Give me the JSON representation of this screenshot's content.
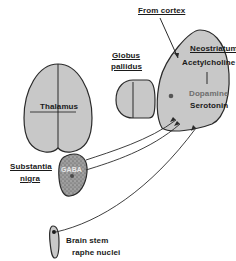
{
  "diagram": {
    "structures": {
      "thalamus": {
        "label": "Thalamus"
      },
      "globus_pallidus": {
        "label_line1": "Globus",
        "label_line2": "pallidus"
      },
      "neostriatum": {
        "label": "Neostriatum"
      },
      "substantia_nigra": {
        "label_line1": "Substantia",
        "label_line2": "nigra",
        "inner_label": "GABA"
      },
      "raphe": {
        "label_line1": "Brain stem",
        "label_line2": "raphe nuclei"
      }
    },
    "inputs": {
      "cortex": {
        "label": "From cortex"
      }
    },
    "transmitters": {
      "acetylcholine": "Acetylcholine",
      "dopamine": "Dopamine",
      "serotonin": "Serotonin"
    },
    "colors": {
      "structure_fill": "#c8c8c8",
      "outline": "#2a2a2a",
      "nigra_fill": "#8a8a8a",
      "text": "#1a1a1a",
      "dopamine_text": "#6e6e6e"
    }
  }
}
